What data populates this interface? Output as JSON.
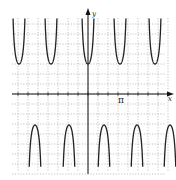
{
  "chart_data": {
    "type": "line",
    "title": "",
    "xlabel": "x",
    "ylabel": "y",
    "function_form": "y = a·sec(b·x)",
    "x_tick_labels": [
      "π"
    ],
    "grid": true,
    "grid_style": "dotted",
    "axes": {
      "origin_px": [
        88,
        94
      ],
      "x_range_px": [
        12,
        170
      ],
      "y_range_px": [
        12,
        174
      ]
    },
    "branches_above_axis": 5,
    "branches_below_axis": 5,
    "upper_branch_min_y_px": 64,
    "lower_branch_max_y_px": 125,
    "branch_centers_px": [
      19,
      51,
      88,
      120,
      155
    ],
    "colors": {
      "curve": "#222222",
      "axis": "#111111",
      "grid": "#9a9a9a"
    }
  },
  "labels": {
    "x_axis": "x",
    "y_axis": "y",
    "pi_tick": "π"
  }
}
